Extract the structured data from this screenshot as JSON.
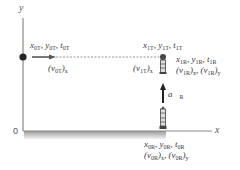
{
  "axes": {
    "y_label": "y",
    "x_label": "x",
    "origin_label": "0"
  },
  "target": {
    "initial": {
      "x": "x",
      "y": "y",
      "t": "t",
      "sub": "0T"
    },
    "velocity_initial": {
      "v": "v",
      "sub": "0T",
      "comp": "x"
    },
    "final": {
      "sub": "1T"
    },
    "velocity_final": {
      "sub": "1T",
      "comp": "x"
    }
  },
  "rocket": {
    "initial_sub": "0R",
    "final_sub": "1R",
    "accel_label": "a",
    "accel_sub": "R"
  },
  "colors": {
    "axis": "#8a8a8a",
    "dot": "#222222",
    "arrow": "#222222",
    "ground": "#c8c8c8"
  }
}
